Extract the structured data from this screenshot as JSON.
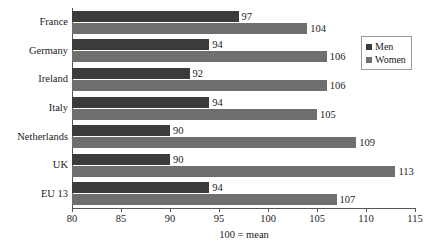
{
  "chart_data": {
    "type": "bar",
    "orientation": "horizontal",
    "title": "",
    "subtitle": "",
    "xlabel": "100 = mean",
    "ylabel": "",
    "xlim": [
      80,
      115
    ],
    "xticks": [
      80,
      85,
      90,
      95,
      100,
      105,
      110,
      115
    ],
    "xtick_labels": [
      "80",
      "85",
      "90",
      "95",
      "100",
      "105",
      "110",
      "115"
    ],
    "grid": false,
    "legend_position": "right",
    "categories": [
      "France",
      "Germany",
      "Ireland",
      "Italy",
      "Netherlands",
      "UK",
      "EU 13"
    ],
    "series": [
      {
        "name": "Men",
        "color": "#3b3b3b",
        "values": [
          97,
          94,
          92,
          94,
          90,
          90,
          94
        ],
        "labels": [
          "97",
          "94",
          "92",
          "94",
          "90",
          "90",
          "94"
        ]
      },
      {
        "name": "Women",
        "color": "#6f6f6f",
        "values": [
          104,
          106,
          106,
          105,
          109,
          113,
          107
        ],
        "labels": [
          "104",
          "106",
          "106",
          "105",
          "109",
          "113",
          "107"
        ]
      }
    ]
  },
  "legend": {
    "items": [
      {
        "label": "Men",
        "color": "#3b3b3b"
      },
      {
        "label": "Women",
        "color": "#6f6f6f"
      }
    ]
  },
  "axis": {
    "x_title": "100 = mean"
  }
}
